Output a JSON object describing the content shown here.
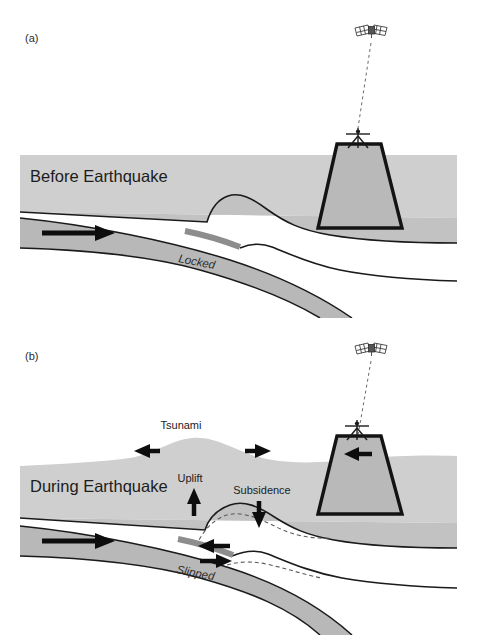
{
  "figure": {
    "width": 477,
    "height": 635,
    "background": "#ffffff"
  },
  "colors": {
    "water": "#cfcfcf",
    "crust": "#c2c2c2",
    "slab": "#b8b8b8",
    "mountain": "#b9b9b9",
    "locked_patch": "#8d8d8d",
    "outline": "#1a1a1a",
    "dashed": "#5a5a5a",
    "arrow": "#0d0d0d",
    "text": "#1c1c1c"
  },
  "panels": [
    {
      "id": "a",
      "letter": "(a)",
      "stage_label": "Before Earthquake",
      "fault_label": "Locked",
      "fault_state": "locked",
      "satellite": {
        "icon": "satellite-icon",
        "label": "",
        "beam": "dashed"
      },
      "gps_station": {
        "icon": "gps-antenna-icon",
        "label": ""
      },
      "arrows": [
        {
          "name": "plate-convergence-arrow",
          "direction": "right",
          "label": ""
        }
      ],
      "annotations": []
    },
    {
      "id": "b",
      "letter": "(b)",
      "stage_label": "During Earthquake",
      "fault_label": "Slipped",
      "fault_state": "slipped",
      "satellite": {
        "icon": "satellite-icon",
        "label": "",
        "beam": "dashed"
      },
      "gps_station": {
        "icon": "gps-antenna-icon",
        "label": ""
      },
      "arrows": [
        {
          "name": "plate-convergence-arrow",
          "direction": "right",
          "label": ""
        },
        {
          "name": "tsunami-arrow-left",
          "direction": "left",
          "label": ""
        },
        {
          "name": "tsunami-arrow-right",
          "direction": "right",
          "label": ""
        },
        {
          "name": "uplift-arrow",
          "direction": "up",
          "label": "Uplift"
        },
        {
          "name": "subsidence-arrow",
          "direction": "down",
          "label": "Subsidence"
        },
        {
          "name": "mountain-seaward-arrow",
          "direction": "left",
          "label": ""
        },
        {
          "name": "slip-arrow-upper",
          "direction": "left",
          "label": ""
        },
        {
          "name": "slip-arrow-lower",
          "direction": "right",
          "label": ""
        }
      ],
      "annotations": [
        {
          "name": "tsunami-label",
          "text": "Tsunami"
        },
        {
          "name": "uplift-label",
          "text": "Uplift"
        },
        {
          "name": "subsidence-label",
          "text": "Subsidence"
        }
      ],
      "dashed_outline_note": "pre-earthquake surface position"
    }
  ]
}
